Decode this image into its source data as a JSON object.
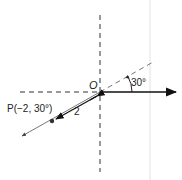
{
  "diagram": {
    "origin_label": "O",
    "angle_label": "30°",
    "distance_label": "2",
    "point_label": "P(−2, 30°)",
    "point": {
      "r": -2,
      "theta_deg": 30
    },
    "colors": {
      "axis": "#333333",
      "ray": "#555555",
      "polar_axis": "#111111",
      "guide": "#dddddd"
    }
  }
}
